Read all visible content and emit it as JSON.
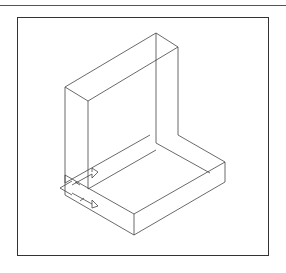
{
  "figure": {
    "type": "isometric-wireframe",
    "annotations": "dimension arrows at lower-left corner of base",
    "line_color": "#333333",
    "frame_color": "#333333",
    "background": "#ffffff"
  }
}
